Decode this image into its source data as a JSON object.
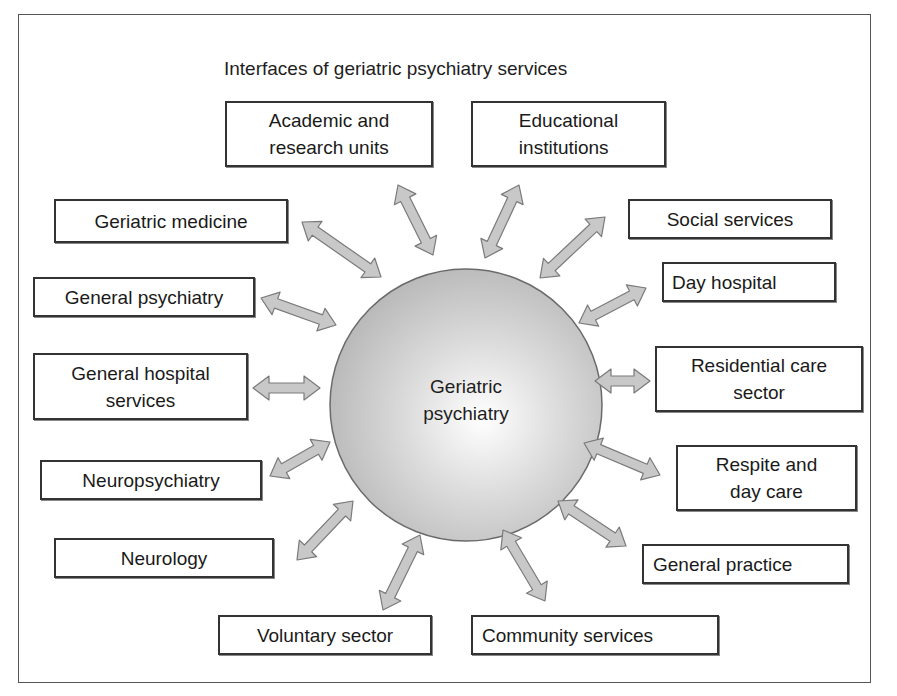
{
  "title": "Interfaces of geriatric psychiatry services",
  "center": {
    "label": "Geriatric\npsychiatry"
  },
  "colors": {
    "arrow_fill": "#c8c8c8",
    "arrow_stroke": "#7a7a7a",
    "box_border": "#333333",
    "circle_light": "#ffffff",
    "circle_dark": "#b4b4b4"
  },
  "nodes": [
    {
      "id": "academic",
      "label": "Academic and\nresearch units"
    },
    {
      "id": "educational",
      "label": "Educational\ninstitutions"
    },
    {
      "id": "geriatric-medicine",
      "label": "Geriatric medicine"
    },
    {
      "id": "social-services",
      "label": "Social services"
    },
    {
      "id": "general-psychiatry",
      "label": "General psychiatry"
    },
    {
      "id": "day-hospital",
      "label": "Day hospital"
    },
    {
      "id": "general-hospital",
      "label": "General hospital\nservices"
    },
    {
      "id": "residential-care",
      "label": "Residential care\nsector"
    },
    {
      "id": "neuropsychiatry",
      "label": "Neuropsychiatry"
    },
    {
      "id": "respite",
      "label": "Respite and\nday care"
    },
    {
      "id": "neurology",
      "label": "Neurology"
    },
    {
      "id": "general-practice",
      "label": "General practice"
    },
    {
      "id": "voluntary",
      "label": "Voluntary sector"
    },
    {
      "id": "community",
      "label": "Community services"
    }
  ]
}
